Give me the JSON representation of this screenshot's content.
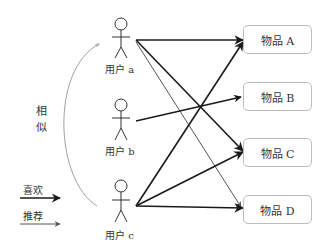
{
  "users": [
    {
      "id": "a",
      "label": "用户 a"
    },
    {
      "id": "b",
      "label": "用户 b"
    },
    {
      "id": "c",
      "label": "用户 c"
    }
  ],
  "items": [
    {
      "id": "A",
      "label": "物品 A"
    },
    {
      "id": "B",
      "label": "物品 B"
    },
    {
      "id": "C",
      "label": "物品 C"
    },
    {
      "id": "D",
      "label": "物品 D"
    }
  ],
  "similarity": {
    "label_1": "相",
    "label_2": "似"
  },
  "legend": {
    "like": "喜欢",
    "recommend": "推荐"
  },
  "edges": [
    {
      "from": "a",
      "to": "A",
      "type": "like"
    },
    {
      "from": "a",
      "to": "C",
      "type": "like"
    },
    {
      "from": "a",
      "to": "D",
      "type": "recommend"
    },
    {
      "from": "b",
      "to": "B",
      "type": "like"
    },
    {
      "from": "c",
      "to": "A",
      "type": "like"
    },
    {
      "from": "c",
      "to": "C",
      "type": "like"
    },
    {
      "from": "c",
      "to": "D",
      "type": "like"
    }
  ],
  "colors": {
    "like": "#1a1a1a",
    "recommend": "#555555",
    "similar": "#888888",
    "box_border": "#bdbdbd"
  }
}
